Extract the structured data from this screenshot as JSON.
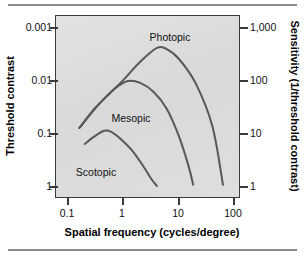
{
  "figure": {
    "rules": [
      "top-rule",
      "bottom-rule"
    ]
  },
  "chart_data": {
    "type": "line",
    "title": "",
    "xlabel": "Spatial frequency (cycles/degree)",
    "ylabel": "Threshold contrast",
    "y2label": "Sensitivity (1/threshold contrast)",
    "xscale": "log",
    "yscale": "log",
    "xlim": [
      0.0631,
      316.2
    ],
    "ylim_left": [
      0.00063,
      1.585
    ],
    "ylim_right": [
      0.631,
      1585
    ],
    "grid": false,
    "legend_position": "inline-annotations",
    "xticks": [
      "0.1",
      "1",
      "10",
      "100"
    ],
    "xtick_values": [
      0.1,
      1,
      10,
      100
    ],
    "yticks_left": [
      "0.001",
      "0.01",
      "0.1",
      "1"
    ],
    "ytick_values_left": [
      0.001,
      0.01,
      0.1,
      1
    ],
    "yticks_right": [
      "1,000",
      "100",
      "10",
      "1"
    ],
    "ytick_values_right": [
      1000,
      100,
      10,
      1
    ],
    "colors": {
      "curve": "#585858",
      "plot_background": "#dcdcdc",
      "frame": "#3a3a3a",
      "text": "#111111"
    },
    "annotations": [
      {
        "text": "Photopic",
        "x": 3.2,
        "y_contrast": 0.0016
      },
      {
        "text": "Mesopic",
        "x": 1.35,
        "y_contrast": 0.032
      },
      {
        "text": "Scotopic",
        "x": 0.62,
        "y_contrast": 0.35
      }
    ],
    "series": [
      {
        "name": "Photopic",
        "points": [
          {
            "x": 0.16,
            "sensitivity": 13
          },
          {
            "x": 0.3,
            "sensitivity": 30
          },
          {
            "x": 0.6,
            "sensitivity": 62
          },
          {
            "x": 1.0,
            "sensitivity": 105
          },
          {
            "x": 2.0,
            "sensitivity": 230
          },
          {
            "x": 4.0,
            "sensitivity": 420
          },
          {
            "x": 6.0,
            "sensitivity": 400
          },
          {
            "x": 10.0,
            "sensitivity": 260
          },
          {
            "x": 20.0,
            "sensitivity": 90
          },
          {
            "x": 40.0,
            "sensitivity": 14
          },
          {
            "x": 62.0,
            "sensitivity": 1.1
          }
        ]
      },
      {
        "name": "Mesopic",
        "points": [
          {
            "x": 0.16,
            "sensitivity": 13
          },
          {
            "x": 0.35,
            "sensitivity": 35
          },
          {
            "x": 0.7,
            "sensitivity": 72
          },
          {
            "x": 1.2,
            "sensitivity": 100
          },
          {
            "x": 2.0,
            "sensitivity": 92
          },
          {
            "x": 3.5,
            "sensitivity": 62
          },
          {
            "x": 6.0,
            "sensitivity": 30
          },
          {
            "x": 10.0,
            "sensitivity": 9
          },
          {
            "x": 15.0,
            "sensitivity": 2.4
          },
          {
            "x": 18.0,
            "sensitivity": 1.1
          }
        ]
      },
      {
        "name": "Scotopic",
        "points": [
          {
            "x": 0.2,
            "sensitivity": 6.5
          },
          {
            "x": 0.3,
            "sensitivity": 9
          },
          {
            "x": 0.45,
            "sensitivity": 11.5
          },
          {
            "x": 0.6,
            "sensitivity": 11
          },
          {
            "x": 0.9,
            "sensitivity": 8
          },
          {
            "x": 1.4,
            "sensitivity": 5
          },
          {
            "x": 2.2,
            "sensitivity": 2.6
          },
          {
            "x": 3.2,
            "sensitivity": 1.4
          },
          {
            "x": 4.0,
            "sensitivity": 1.05
          }
        ]
      }
    ]
  }
}
